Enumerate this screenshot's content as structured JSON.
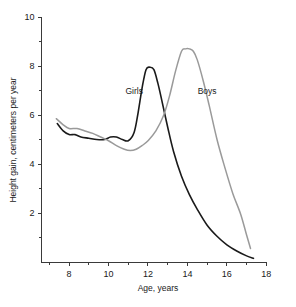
{
  "chart_data": {
    "type": "line",
    "title": "",
    "xlabel": "Age, years",
    "ylabel": "Height gain, centimeters per year",
    "xlim": [
      6.6,
      18
    ],
    "ylim": [
      0,
      10
    ],
    "xticks": [
      8,
      10,
      12,
      14,
      16,
      18
    ],
    "xtick_labels": [
      "8",
      "10",
      "12",
      "14",
      "16",
      "18"
    ],
    "xminor_ticks": [
      7,
      9,
      11,
      13,
      15,
      17
    ],
    "yticks": [
      2,
      4,
      6,
      8,
      10
    ],
    "ytick_labels": [
      "2",
      "4",
      "6",
      "8",
      "10"
    ],
    "yminor_ticks": [
      1,
      3,
      5,
      7,
      9
    ],
    "grid": false,
    "legend_position": "inline-annotations",
    "series": [
      {
        "name": "Girls",
        "color": "#1a1a1a",
        "label_x": 11.3,
        "label_y": 6.85,
        "x": [
          7.4,
          7.7,
          8.0,
          8.3,
          8.6,
          9.0,
          9.4,
          9.8,
          10.1,
          10.4,
          10.7,
          11.0,
          11.3,
          11.5,
          11.7,
          11.9,
          12.1,
          12.3,
          12.5,
          12.7,
          13.0,
          13.3,
          13.7,
          14.1,
          14.5,
          15.0,
          15.5,
          16.0,
          16.5,
          17.0,
          17.35
        ],
        "y": [
          5.65,
          5.35,
          5.2,
          5.2,
          5.1,
          5.05,
          5.0,
          5.0,
          5.1,
          5.1,
          5.0,
          4.95,
          5.3,
          6.1,
          7.1,
          7.85,
          7.95,
          7.85,
          7.3,
          6.6,
          5.5,
          4.5,
          3.5,
          2.75,
          2.15,
          1.5,
          1.05,
          0.7,
          0.45,
          0.25,
          0.15
        ]
      },
      {
        "name": "Boys",
        "color": "#9a9a9a",
        "label_x": 15.0,
        "label_y": 6.85,
        "x": [
          7.35,
          7.7,
          8.0,
          8.4,
          8.8,
          9.2,
          9.6,
          10.0,
          10.4,
          10.8,
          11.1,
          11.4,
          11.7,
          12.0,
          12.4,
          12.8,
          13.1,
          13.4,
          13.7,
          13.9,
          14.1,
          14.3,
          14.5,
          14.8,
          15.1,
          15.5,
          15.9,
          16.3,
          16.7,
          17.0,
          17.2
        ],
        "y": [
          5.85,
          5.6,
          5.45,
          5.45,
          5.35,
          5.25,
          5.1,
          4.95,
          4.75,
          4.6,
          4.55,
          4.6,
          4.75,
          4.95,
          5.35,
          6.0,
          6.8,
          7.8,
          8.6,
          8.7,
          8.7,
          8.6,
          8.25,
          7.4,
          6.4,
          5.0,
          3.85,
          2.8,
          1.95,
          1.1,
          0.55
        ]
      }
    ]
  }
}
